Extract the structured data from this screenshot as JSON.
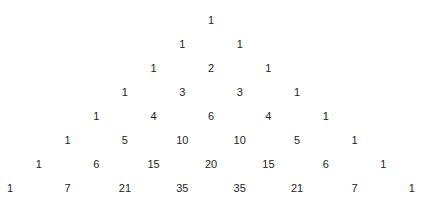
{
  "rows": [
    [
      1
    ],
    [
      1,
      1
    ],
    [
      1,
      2,
      1
    ],
    [
      1,
      3,
      3,
      1
    ],
    [
      1,
      4,
      6,
      4,
      1
    ],
    [
      1,
      5,
      10,
      10,
      5,
      1
    ],
    [
      1,
      6,
      15,
      20,
      15,
      6,
      1
    ],
    [
      1,
      7,
      21,
      35,
      35,
      21,
      7,
      1
    ]
  ],
  "colors": {
    "text": "#222222",
    "background": "#ffffff"
  }
}
